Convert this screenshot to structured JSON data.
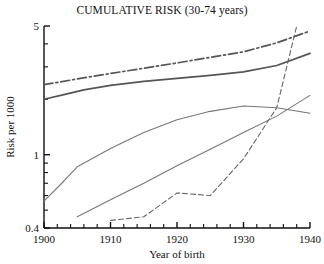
{
  "chart_data": {
    "type": "line",
    "title": "CUMULATIVE RISK (30-74 years)",
    "xlabel": "Year of birth",
    "ylabel": "Risk per 1000",
    "yscale": "log",
    "xlim": [
      1900,
      1940
    ],
    "ylim": [
      0.4,
      5
    ],
    "grid": false,
    "legend": "none",
    "y_tick_labels": [
      "5",
      "1",
      "0.4"
    ],
    "y_tick_values": [
      5,
      1,
      0.4
    ],
    "x_tick_labels": [
      "1900",
      "1910",
      "1920",
      "1930",
      "1940"
    ],
    "x_tick_values": [
      1900,
      1910,
      1920,
      1930,
      1940
    ],
    "x_minor_tick_step": 2,
    "series": [
      {
        "name": "dash-dot-upper",
        "style": "dash-dot",
        "color": "#555555",
        "x": [
          1900,
          1905,
          1910,
          1915,
          1920,
          1925,
          1930,
          1935,
          1940
        ],
        "y": [
          2.4,
          2.58,
          2.76,
          2.95,
          3.15,
          3.38,
          3.62,
          4.05,
          4.7
        ]
      },
      {
        "name": "solid-upper",
        "style": "solid",
        "color": "#555555",
        "x": [
          1900,
          1903,
          1906,
          1910,
          1915,
          1920,
          1925,
          1930,
          1935,
          1940
        ],
        "y": [
          2.0,
          2.12,
          2.25,
          2.38,
          2.5,
          2.6,
          2.7,
          2.82,
          3.05,
          3.55
        ]
      },
      {
        "name": "thin-rise-then-fall",
        "style": "solid-thin",
        "color": "#777777",
        "x": [
          1900,
          1903,
          1905,
          1910,
          1915,
          1920,
          1925,
          1930,
          1935,
          1940
        ],
        "y": [
          0.56,
          0.72,
          0.86,
          1.08,
          1.32,
          1.55,
          1.72,
          1.84,
          1.8,
          1.68
        ]
      },
      {
        "name": "straight-rising",
        "style": "solid-thin",
        "color": "#777777",
        "x": [
          1905,
          1910,
          1915,
          1920,
          1925,
          1930,
          1935,
          1940
        ],
        "y": [
          0.46,
          0.57,
          0.7,
          0.87,
          1.07,
          1.32,
          1.62,
          2.1
        ]
      },
      {
        "name": "dashed-lower",
        "style": "dashed",
        "color": "#666666",
        "x": [
          1910,
          1915,
          1920,
          1925,
          1930,
          1935,
          1938
        ],
        "y": [
          0.44,
          0.46,
          0.62,
          0.6,
          0.95,
          1.8,
          5.0
        ]
      }
    ]
  }
}
